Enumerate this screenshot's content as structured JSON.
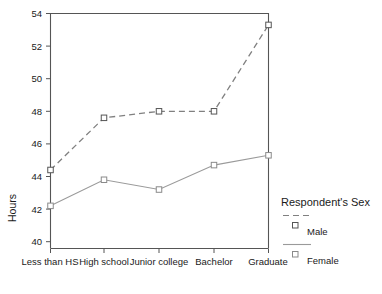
{
  "chart_data": {
    "type": "line",
    "title": "",
    "xlabel": "",
    "ylabel": "Hours",
    "categories": [
      "Less than HS",
      "High school",
      "Junior college",
      "Bachelor",
      "Graduate"
    ],
    "series": [
      {
        "name": "Male",
        "linestyle": "dashed",
        "marker": "square",
        "values": [
          44.4,
          47.6,
          48.0,
          48.0,
          53.3
        ]
      },
      {
        "name": "Female",
        "linestyle": "solid",
        "marker": "square",
        "values": [
          42.2,
          43.8,
          43.2,
          44.7,
          45.3
        ]
      }
    ],
    "ylim": [
      40,
      54
    ],
    "yticks": [
      40,
      42,
      44,
      46,
      48,
      50,
      52,
      54
    ],
    "ytick_labels": [
      "40",
      "42",
      "44",
      "46",
      "48",
      "50",
      "52",
      "54"
    ],
    "grid": false,
    "legend": {
      "title": "Respondent's Sex",
      "position": "right"
    },
    "colors": {
      "line": "#808080",
      "axis": "#555555",
      "text": "#1a1a1a"
    }
  },
  "legend": {
    "title": "Respondent's Sex",
    "entries": [
      {
        "label": "Male",
        "style": "dashed"
      },
      {
        "label": "Female",
        "style": "solid"
      }
    ]
  },
  "axes": {
    "y_title": "Hours"
  }
}
